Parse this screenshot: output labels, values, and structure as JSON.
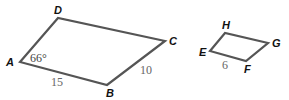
{
  "figure": {
    "shape1": {
      "name": "ABCD",
      "vertices": {
        "A": "A",
        "B": "B",
        "C": "C",
        "D": "D"
      },
      "angle_A": "66°",
      "side_AB": "15",
      "side_BC": "10"
    },
    "shape2": {
      "name": "EFGH",
      "vertices": {
        "E": "E",
        "F": "F",
        "G": "G",
        "H": "H"
      },
      "side_EF": "6"
    },
    "colors": {
      "stroke": "#555555",
      "vertex_label": "#111111",
      "measure_label": "#666666"
    }
  }
}
